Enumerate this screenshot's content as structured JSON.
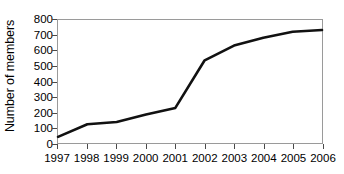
{
  "chart_data": {
    "type": "line",
    "title": "",
    "xlabel": "",
    "ylabel": "Number of members",
    "categories": [
      "1997",
      "1998",
      "1999",
      "2000",
      "2001",
      "2002",
      "2003",
      "2004",
      "2005",
      "2006"
    ],
    "values": [
      40,
      122,
      137,
      185,
      228,
      538,
      634,
      685,
      723,
      735
    ],
    "series": [
      {
        "name": "Number of members",
        "values": [
          40,
          122,
          137,
          185,
          228,
          538,
          634,
          685,
          723,
          735
        ]
      }
    ],
    "ylim": [
      0,
      800
    ],
    "yticks": [
      0,
      100,
      200,
      300,
      400,
      500,
      600,
      700,
      800
    ],
    "ytick_labels": [
      "0",
      "100",
      "200",
      "300",
      "400",
      "500",
      "600",
      "700",
      "800"
    ],
    "grid": false,
    "legend": "none",
    "line_color": "#111111",
    "frame_color": "#9a9a9a",
    "background_color": "#ffffff",
    "markers": false
  }
}
